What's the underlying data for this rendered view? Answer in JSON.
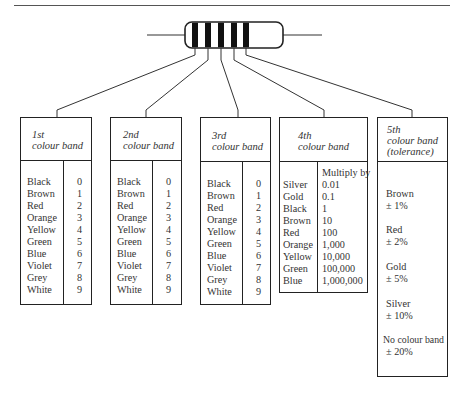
{
  "diagram": {
    "resistor": {
      "bands": 5,
      "band_color": "#111111",
      "body_outline": "#222222"
    },
    "boxes": [
      {
        "id": "band1",
        "header": [
          "1st",
          "colour band"
        ],
        "rows": [
          {
            "colour": "Black",
            "value": "0"
          },
          {
            "colour": "Brown",
            "value": "1"
          },
          {
            "colour": "Red",
            "value": "2"
          },
          {
            "colour": "Orange",
            "value": "3"
          },
          {
            "colour": "Yellow",
            "value": "4"
          },
          {
            "colour": "Green",
            "value": "5"
          },
          {
            "colour": "Blue",
            "value": "6"
          },
          {
            "colour": "Violet",
            "value": "7"
          },
          {
            "colour": "Grey",
            "value": "8"
          },
          {
            "colour": "White",
            "value": "9"
          }
        ]
      },
      {
        "id": "band2",
        "header": [
          "2nd",
          "colour band"
        ],
        "rows": [
          {
            "colour": "Black",
            "value": "0"
          },
          {
            "colour": "Brown",
            "value": "1"
          },
          {
            "colour": "Red",
            "value": "2"
          },
          {
            "colour": "Orange",
            "value": "3"
          },
          {
            "colour": "Yellow",
            "value": "4"
          },
          {
            "colour": "Green",
            "value": "5"
          },
          {
            "colour": "Blue",
            "value": "6"
          },
          {
            "colour": "Violet",
            "value": "7"
          },
          {
            "colour": "Grey",
            "value": "8"
          },
          {
            "colour": "White",
            "value": "9"
          }
        ]
      },
      {
        "id": "band3",
        "header": [
          "3rd",
          "colour band"
        ],
        "rows": [
          {
            "colour": "Black",
            "value": "0"
          },
          {
            "colour": "Brown",
            "value": "1"
          },
          {
            "colour": "Red",
            "value": "2"
          },
          {
            "colour": "Orange",
            "value": "3"
          },
          {
            "colour": "Yellow",
            "value": "4"
          },
          {
            "colour": "Green",
            "value": "5"
          },
          {
            "colour": "Blue",
            "value": "6"
          },
          {
            "colour": "Violet",
            "value": "7"
          },
          {
            "colour": "Grey",
            "value": "8"
          },
          {
            "colour": "White",
            "value": "9"
          }
        ]
      },
      {
        "id": "band4",
        "header": [
          "4th",
          "colour band"
        ],
        "column_header": "Multiply by",
        "rows": [
          {
            "colour": "Silver",
            "value": "0.01"
          },
          {
            "colour": "Gold",
            "value": "0.1"
          },
          {
            "colour": "Black",
            "value": "1"
          },
          {
            "colour": "Brown",
            "value": "10"
          },
          {
            "colour": "Red",
            "value": "100"
          },
          {
            "colour": "Orange",
            "value": "1,000"
          },
          {
            "colour": "Yellow",
            "value": "10,000"
          },
          {
            "colour": "Green",
            "value": "100,000"
          },
          {
            "colour": "Blue",
            "value": "1,000,000"
          }
        ]
      },
      {
        "id": "band5",
        "header": [
          "5th",
          "colour band",
          "(tolerance)"
        ],
        "entries": [
          {
            "colour": "Brown",
            "tolerance": "± 1%"
          },
          {
            "colour": "Red",
            "tolerance": "± 2%"
          },
          {
            "colour": "Gold",
            "tolerance": "± 5%"
          },
          {
            "colour": "Silver",
            "tolerance": "± 10%"
          },
          {
            "colour": "No colour band",
            "tolerance": "± 20%"
          }
        ]
      }
    ]
  }
}
